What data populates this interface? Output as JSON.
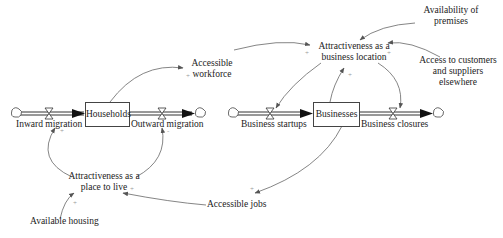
{
  "diagram": {
    "type": "stock-and-flow",
    "stocks": [
      {
        "id": "households",
        "label": "Households"
      },
      {
        "id": "businesses",
        "label": "Businesses"
      }
    ],
    "flows": [
      {
        "id": "inward",
        "label": "Inward migration"
      },
      {
        "id": "outward",
        "label": "Outward migration"
      },
      {
        "id": "startups",
        "label": "Business startups"
      },
      {
        "id": "closures",
        "label": "Business closures"
      }
    ],
    "variables": {
      "accessible_workforce": [
        "Accessible",
        "workforce"
      ],
      "attract_business": [
        "Attractiveness as a",
        "business location"
      ],
      "availability_premises": [
        "Availability of",
        "premises"
      ],
      "access_customers": [
        "Access to customers",
        "and suppliers",
        "elsewhere"
      ],
      "attract_live": [
        "Attractiveness as a",
        "place to live"
      ],
      "available_housing": "Available housing",
      "accessible_jobs": "Accessible jobs"
    },
    "polarity": "+",
    "polarity_neg": "-",
    "links": [
      {
        "from": "Households",
        "to": "Accessible workforce",
        "sign": "+"
      },
      {
        "from": "Accessible workforce",
        "to": "Attractiveness as a business location",
        "sign": "+"
      },
      {
        "from": "Availability of premises",
        "to": "Attractiveness as a business location",
        "sign": "+"
      },
      {
        "from": "Access to customers and suppliers elsewhere",
        "to": "Attractiveness as a business location",
        "sign": "+"
      },
      {
        "from": "Attractiveness as a business location",
        "to": "Business startups",
        "sign": "+"
      },
      {
        "from": "Attractiveness as a business location",
        "to": "Business closures",
        "sign": "-"
      },
      {
        "from": "Businesses",
        "to": "Attractiveness as a business location",
        "sign": "+"
      },
      {
        "from": "Businesses",
        "to": "Accessible jobs",
        "sign": "+"
      },
      {
        "from": "Accessible jobs",
        "to": "Attractiveness as a place to live",
        "sign": "+"
      },
      {
        "from": "Available housing",
        "to": "Attractiveness as a place to live",
        "sign": "+"
      },
      {
        "from": "Attractiveness as a place to live",
        "to": "Inward migration",
        "sign": "+"
      },
      {
        "from": "Attractiveness as a place to live",
        "to": "Outward migration",
        "sign": "-"
      }
    ]
  }
}
